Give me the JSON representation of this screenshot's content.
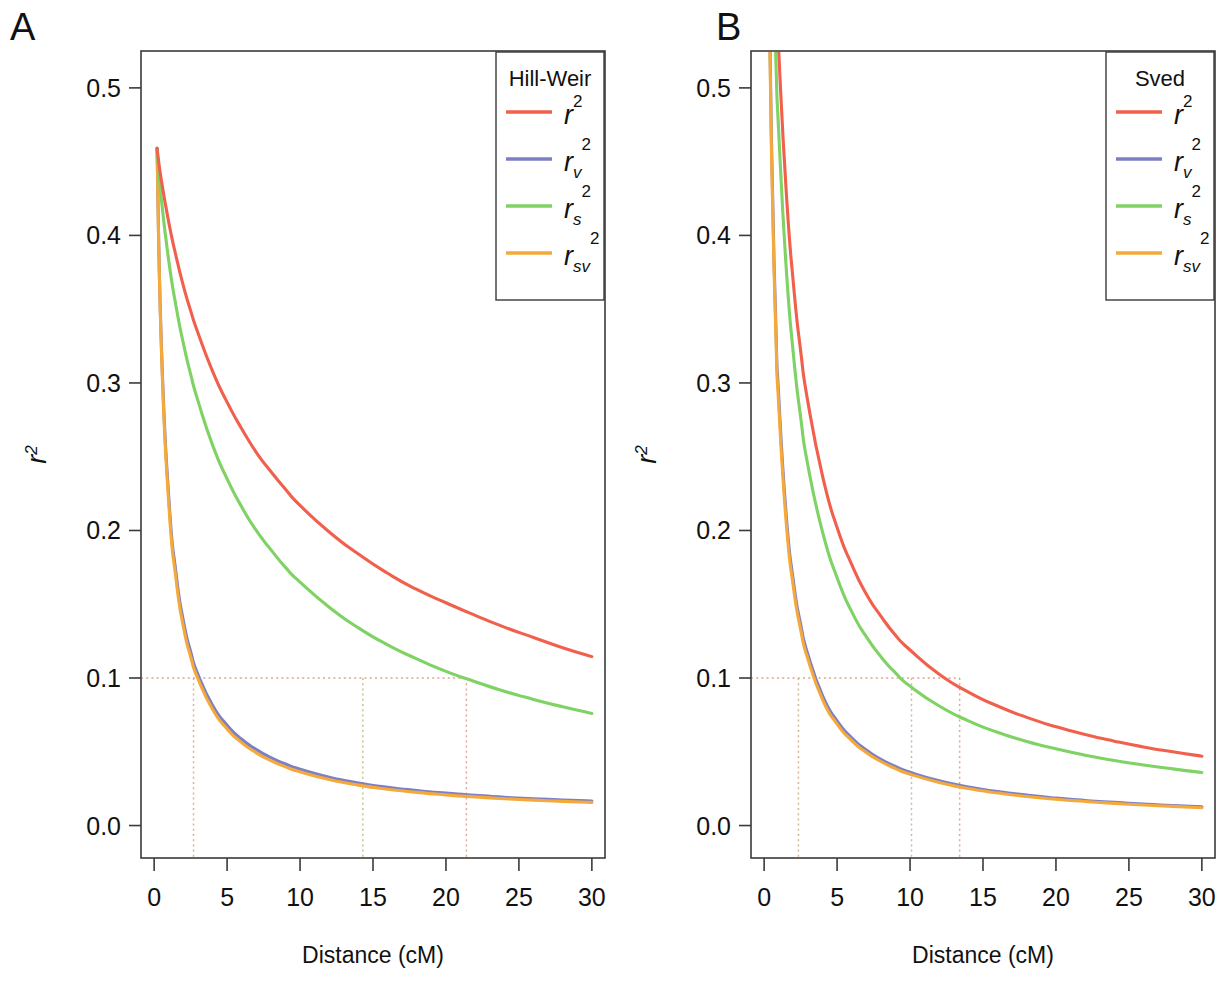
{
  "figure": {
    "panels": [
      {
        "letter": "A",
        "legend_title": "Hill-Weir",
        "xlabel": "Distance (cM)",
        "ylabel": "r2"
      },
      {
        "letter": "B",
        "legend_title": "Sved",
        "xlabel": "Distance (cM)",
        "ylabel": "r2"
      }
    ]
  },
  "axes": {
    "x_ticks": [
      "0",
      "5",
      "10",
      "15",
      "20",
      "25",
      "30"
    ],
    "y_ticks": [
      "0.0",
      "0.1",
      "0.2",
      "0.3",
      "0.4",
      "0.5"
    ],
    "x_tick_values": [
      0,
      5,
      10,
      15,
      20,
      25,
      30
    ],
    "y_tick_values": [
      0.0,
      0.1,
      0.2,
      0.3,
      0.4,
      0.5
    ],
    "xlim": [
      -0.9,
      30.9
    ],
    "ylim": [
      -0.022,
      0.525
    ],
    "xlabel": "Distance (cM)",
    "ylabel": "r2"
  },
  "legend": {
    "entries": [
      {
        "label": "r",
        "sup": "2",
        "sub": "",
        "color": "#F0604C",
        "name": "r2"
      },
      {
        "label": "r",
        "sup": "2",
        "sub": "v",
        "color": "#7B7FC6",
        "name": "r2v"
      },
      {
        "label": "r",
        "sup": "2",
        "sub": "s",
        "color": "#7FD264",
        "name": "r2s"
      },
      {
        "label": "r",
        "sup": "2",
        "sub": "sv",
        "color": "#F5A93B",
        "name": "r2sv"
      }
    ]
  },
  "colors": {
    "r2": "#F0604C",
    "r2v": "#7B7FC6",
    "r2s": "#7FD264",
    "r2sv": "#F5A93B",
    "axis": "#3a3a3a",
    "background": "#ffffff"
  },
  "chart_data": {
    "type": "line",
    "xlabel": "Distance (cM)",
    "ylabel": "r2",
    "xlim": [
      0,
      30
    ],
    "ylim": [
      0.0,
      0.52
    ],
    "grid": false,
    "legend_position": "top-right",
    "panels": [
      {
        "letter": "A",
        "legend_title": "Hill-Weir",
        "threshold": {
          "y": 0.1,
          "label": "0.1 reference line",
          "style": "dotted"
        },
        "series": [
          {
            "name": "r2",
            "color": "#F0604C",
            "crossing_x_at_0.1": 21.4,
            "x": [
              0.2,
              0.5,
              1,
              1.5,
              2,
              2.5,
              3,
              4,
              5,
              6,
              7,
              8,
              9,
              10,
              12,
              14,
              16,
              18,
              20,
              22,
              24,
              26,
              28,
              30
            ],
            "y": [
              0.459,
              0.437,
              0.409,
              0.386,
              0.366,
              0.349,
              0.334,
              0.308,
              0.287,
              0.269,
              0.253,
              0.24,
              0.228,
              0.217,
              0.199,
              0.184,
              0.171,
              0.16,
              0.151,
              0.1425,
              0.1345,
              0.1275,
              0.1205,
              0.1145
            ],
            "note": "Panel A Hill-Weir r2 decay curve, starts 0.459 at 0.2 cM"
          },
          {
            "name": "r2s",
            "color": "#7FD264",
            "crossing_x_at_0.1": 14.3,
            "x": [
              0.2,
              0.5,
              1,
              1.5,
              2,
              2.5,
              3,
              4,
              5,
              6,
              7,
              8,
              9,
              10,
              12,
              14,
              16,
              18,
              20,
              22,
              24,
              26,
              28,
              30
            ],
            "y": [
              0.459,
              0.424,
              0.383,
              0.352,
              0.327,
              0.306,
              0.288,
              0.258,
              0.235,
              0.216,
              0.2,
              0.187,
              0.175,
              0.165,
              0.148,
              0.134,
              0.1225,
              0.113,
              0.1045,
              0.0975,
              0.091,
              0.0855,
              0.0805,
              0.076
            ],
            "note": "Panel A Hill-Weir r2_s curve"
          },
          {
            "name": "r2v",
            "color": "#7B7FC6",
            "crossing_x_at_0.1": 2.7,
            "x": [
              0.2,
              0.5,
              1,
              1.5,
              2,
              2.5,
              3,
              4,
              5,
              6,
              7,
              8,
              9,
              10,
              12,
              14,
              16,
              18,
              20,
              22,
              24,
              26,
              28,
              30
            ],
            "y": [
              0.459,
              0.325,
              0.223,
              0.171,
              0.139,
              0.118,
              0.1025,
              0.0815,
              0.068,
              0.0585,
              0.0515,
              0.046,
              0.0417,
              0.0382,
              0.0328,
              0.0289,
              0.026,
              0.0238,
              0.022,
              0.0205,
              0.0192,
              0.0182,
              0.0173,
              0.0166
            ],
            "note": "Panel A Hill-Weir r2_v curve, nearly overlapping r2_sv"
          },
          {
            "name": "r2sv",
            "color": "#F5A93B",
            "crossing_x_at_0.1": 2.65,
            "x": [
              0.2,
              0.5,
              1,
              1.5,
              2,
              2.5,
              3,
              4,
              5,
              6,
              7,
              8,
              9,
              10,
              12,
              14,
              16,
              18,
              20,
              22,
              24,
              26,
              28,
              30
            ],
            "y": [
              0.459,
              0.322,
              0.219,
              0.167,
              0.135,
              0.1145,
              0.0995,
              0.0788,
              0.0655,
              0.0562,
              0.0493,
              0.044,
              0.0398,
              0.0364,
              0.0312,
              0.0274,
              0.0246,
              0.0225,
              0.0208,
              0.0194,
              0.0182,
              0.0172,
              0.0164,
              0.0157
            ],
            "note": "Panel A Hill-Weir r2_sv curve, nearly overlapping r2_v"
          }
        ],
        "vertical_markers": [
          2.7,
          14.3,
          21.4
        ]
      },
      {
        "letter": "B",
        "legend_title": "Sved",
        "threshold": {
          "y": 0.1,
          "label": "0.1 reference line",
          "style": "dotted"
        },
        "series": [
          {
            "name": "r2",
            "color": "#F0604C",
            "crossing_x_at_0.1": 13.4,
            "x": [
              0.3,
              0.5,
              0.8,
              1,
              1.5,
              2,
              2.5,
              3,
              4,
              5,
              6,
              7,
              8,
              9,
              10,
              12,
              14,
              16,
              18,
              20,
              22,
              24,
              26,
              28,
              30
            ],
            "y": [
              0.78,
              0.68,
              0.575,
              0.525,
              0.432,
              0.368,
              0.322,
              0.287,
              0.237,
              0.202,
              0.177,
              0.157,
              0.142,
              0.129,
              0.119,
              0.1025,
              0.0905,
              0.081,
              0.0733,
              0.067,
              0.0617,
              0.0572,
              0.0533,
              0.05,
              0.047
            ],
            "note": "Panel B Sved r2 curve; rises above plot top near x=0"
          },
          {
            "name": "r2s",
            "color": "#7FD264",
            "crossing_x_at_0.1": 10.1,
            "x": [
              0.3,
              0.5,
              0.8,
              1,
              1.5,
              2,
              2.5,
              3,
              4,
              5,
              6,
              7,
              8,
              9,
              10,
              12,
              14,
              16,
              18,
              20,
              22,
              24,
              26,
              28,
              30
            ],
            "y": [
              0.72,
              0.625,
              0.52,
              0.47,
              0.38,
              0.32,
              0.277,
              0.244,
              0.199,
              0.168,
              0.145,
              0.128,
              0.1145,
              0.1035,
              0.0945,
              0.081,
              0.071,
              0.0632,
              0.057,
              0.052,
              0.0477,
              0.0441,
              0.0411,
              0.0384,
              0.036
            ],
            "note": "Panel B Sved r2_s curve; rises above plot top near x=0"
          },
          {
            "name": "r2v",
            "color": "#7B7FC6",
            "crossing_x_at_0.1": 2.35,
            "x": [
              0.3,
              0.5,
              0.8,
              1,
              1.5,
              2,
              2.5,
              3,
              4,
              5,
              6,
              7,
              8,
              9,
              10,
              12,
              14,
              16,
              18,
              20,
              22,
              24,
              26,
              28,
              30
            ],
            "y": [
              0.6,
              0.465,
              0.34,
              0.291,
              0.212,
              0.166,
              0.1365,
              0.116,
              0.088,
              0.071,
              0.0595,
              0.0512,
              0.0449,
              0.04,
              0.0361,
              0.0303,
              0.0261,
              0.023,
              0.0206,
              0.0186,
              0.017,
              0.0157,
              0.0145,
              0.0136,
              0.0127
            ],
            "note": "Panel B Sved r2_v curve, nearly overlapping r2_sv"
          },
          {
            "name": "r2sv",
            "color": "#F5A93B",
            "crossing_x_at_0.1": 2.3,
            "x": [
              0.3,
              0.5,
              0.8,
              1,
              1.5,
              2,
              2.5,
              3,
              4,
              5,
              6,
              7,
              8,
              9,
              10,
              12,
              14,
              16,
              18,
              20,
              22,
              24,
              26,
              28,
              30
            ],
            "y": [
              0.59,
              0.458,
              0.334,
              0.285,
              0.207,
              0.162,
              0.133,
              0.1128,
              0.0854,
              0.0688,
              0.0576,
              0.0495,
              0.0434,
              0.0386,
              0.0348,
              0.0292,
              0.0251,
              0.0221,
              0.0197,
              0.0178,
              0.0163,
              0.015,
              0.0139,
              0.013,
              0.0121
            ],
            "note": "Panel B Sved r2_sv curve, nearly overlapping r2_v"
          }
        ],
        "vertical_markers": [
          2.35,
          10.1,
          13.4
        ]
      }
    ]
  }
}
